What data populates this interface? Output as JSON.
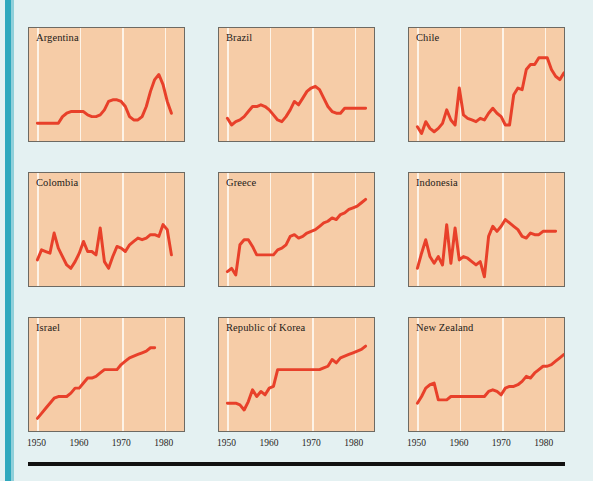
{
  "figure": {
    "background_color": "#e4f1f2",
    "panel_fill": "#f6cca7",
    "panel_border": "#6d6a63",
    "line_color": "#e8402a",
    "gridline_color": "#fdf4ea",
    "spine_color": "#2fa8bd",
    "rule_color": "#111111"
  },
  "chart_data": {
    "type": "line",
    "title": "",
    "xlabel": "",
    "ylabel": "",
    "xlim": [
      1948,
      1985
    ],
    "grid": true,
    "gridlines_at": [
      1950,
      1960,
      1970,
      1980
    ],
    "tick_labels": [
      "1950",
      "1960",
      "1970",
      "1980"
    ],
    "legend": "none",
    "layout": {
      "rows": 3,
      "cols": 3
    },
    "panels": [
      {
        "name": "Argentina",
        "row": 0,
        "col": 0,
        "x": [
          1950,
          1951,
          1952,
          1953,
          1954,
          1955,
          1956,
          1957,
          1958,
          1959,
          1960,
          1961,
          1962,
          1963,
          1964,
          1965,
          1966,
          1967,
          1968,
          1969,
          1970,
          1971,
          1972,
          1973,
          1974,
          1975,
          1976,
          1977,
          1978,
          1979,
          1980,
          1981,
          1982
        ],
        "y": [
          14,
          14,
          14,
          14,
          14,
          14,
          22,
          26,
          28,
          28,
          28,
          28,
          24,
          22,
          22,
          24,
          30,
          40,
          42,
          42,
          40,
          34,
          22,
          18,
          18,
          22,
          34,
          52,
          66,
          72,
          60,
          40,
          26
        ]
      },
      {
        "name": "Brazil",
        "row": 0,
        "col": 1,
        "x": [
          1950,
          1951,
          1952,
          1953,
          1954,
          1955,
          1956,
          1957,
          1958,
          1959,
          1960,
          1961,
          1962,
          1963,
          1964,
          1965,
          1966,
          1967,
          1968,
          1969,
          1970,
          1971,
          1972,
          1973,
          1974,
          1975,
          1976,
          1977,
          1978,
          1979,
          1980,
          1981,
          1982,
          1983
        ],
        "y": [
          20,
          12,
          16,
          18,
          22,
          28,
          34,
          34,
          36,
          34,
          30,
          24,
          18,
          16,
          22,
          30,
          40,
          36,
          44,
          52,
          56,
          58,
          54,
          44,
          34,
          28,
          26,
          26,
          32,
          32,
          32,
          32,
          32,
          32
        ]
      },
      {
        "name": "Chile",
        "row": 0,
        "col": 2,
        "x": [
          1950,
          1951,
          1952,
          1953,
          1954,
          1955,
          1956,
          1957,
          1958,
          1959,
          1960,
          1961,
          1962,
          1963,
          1964,
          1965,
          1966,
          1967,
          1968,
          1969,
          1970,
          1971,
          1972,
          1973,
          1974,
          1975,
          1976,
          1977,
          1978,
          1979,
          1980,
          1981,
          1982,
          1983,
          1984,
          1985
        ],
        "y": [
          10,
          2,
          16,
          8,
          4,
          8,
          14,
          30,
          18,
          12,
          56,
          24,
          20,
          18,
          16,
          20,
          18,
          26,
          32,
          26,
          22,
          12,
          12,
          48,
          56,
          54,
          78,
          84,
          84,
          92,
          92,
          92,
          78,
          70,
          66,
          74
        ]
      },
      {
        "name": "Colombia",
        "row": 1,
        "col": 0,
        "x": [
          1950,
          1951,
          1952,
          1953,
          1954,
          1955,
          1956,
          1957,
          1958,
          1959,
          1960,
          1961,
          1962,
          1963,
          1964,
          1965,
          1966,
          1967,
          1968,
          1969,
          1970,
          1971,
          1972,
          1973,
          1974,
          1975,
          1976,
          1977,
          1978,
          1979,
          1980,
          1981,
          1982
        ],
        "y": [
          24,
          36,
          34,
          32,
          56,
          38,
          28,
          18,
          14,
          22,
          32,
          46,
          34,
          34,
          30,
          62,
          22,
          14,
          28,
          40,
          38,
          34,
          42,
          46,
          50,
          48,
          50,
          54,
          54,
          52,
          66,
          60,
          30
        ]
      },
      {
        "name": "Greece",
        "row": 1,
        "col": 1,
        "x": [
          1950,
          1951,
          1952,
          1953,
          1954,
          1955,
          1956,
          1957,
          1958,
          1959,
          1960,
          1961,
          1962,
          1963,
          1964,
          1965,
          1966,
          1967,
          1968,
          1969,
          1970,
          1971,
          1972,
          1973,
          1974,
          1975,
          1976,
          1977,
          1978,
          1979,
          1980,
          1981,
          1982,
          1983
        ],
        "y": [
          10,
          14,
          6,
          42,
          48,
          48,
          40,
          30,
          30,
          30,
          30,
          30,
          36,
          38,
          42,
          52,
          54,
          50,
          52,
          56,
          58,
          60,
          64,
          68,
          70,
          74,
          72,
          78,
          80,
          84,
          86,
          88,
          92,
          96
        ]
      },
      {
        "name": "Indonesia",
        "row": 1,
        "col": 2,
        "x": [
          1950,
          1951,
          1952,
          1953,
          1954,
          1955,
          1956,
          1957,
          1958,
          1959,
          1960,
          1961,
          1962,
          1963,
          1964,
          1965,
          1966,
          1967,
          1968,
          1969,
          1970,
          1971,
          1972,
          1973,
          1974,
          1975,
          1976,
          1977,
          1978,
          1979,
          1980,
          1981,
          1982,
          1983
        ],
        "y": [
          14,
          32,
          48,
          28,
          20,
          28,
          18,
          66,
          20,
          62,
          24,
          28,
          26,
          22,
          18,
          22,
          4,
          52,
          64,
          58,
          64,
          72,
          68,
          64,
          60,
          52,
          50,
          56,
          54,
          54,
          58,
          58,
          58,
          58
        ]
      },
      {
        "name": "Israel",
        "row": 2,
        "col": 0,
        "x": [
          1950,
          1951,
          1952,
          1953,
          1954,
          1955,
          1956,
          1957,
          1958,
          1959,
          1960,
          1961,
          1962,
          1963,
          1964,
          1965,
          1966,
          1967,
          1968,
          1969,
          1970,
          1971,
          1972,
          1973,
          1974,
          1975,
          1976,
          1977,
          1978
        ],
        "y": [
          8,
          14,
          20,
          26,
          32,
          34,
          34,
          34,
          38,
          44,
          44,
          50,
          56,
          56,
          58,
          62,
          66,
          66,
          66,
          66,
          72,
          76,
          80,
          82,
          84,
          86,
          88,
          92,
          92
        ]
      },
      {
        "name": "Republic of Korea",
        "row": 2,
        "col": 1,
        "x": [
          1950,
          1951,
          1952,
          1953,
          1954,
          1955,
          1956,
          1957,
          1958,
          1959,
          1960,
          1961,
          1962,
          1963,
          1964,
          1965,
          1966,
          1967,
          1968,
          1969,
          1970,
          1971,
          1972,
          1973,
          1974,
          1975,
          1976,
          1977,
          1978,
          1979,
          1980,
          1981,
          1982,
          1983
        ],
        "y": [
          26,
          26,
          26,
          24,
          18,
          28,
          42,
          34,
          40,
          36,
          44,
          46,
          66,
          66,
          66,
          66,
          66,
          66,
          66,
          66,
          66,
          66,
          66,
          68,
          70,
          78,
          74,
          80,
          82,
          84,
          86,
          88,
          90,
          94
        ]
      },
      {
        "name": "New Zealand",
        "row": 2,
        "col": 2,
        "x": [
          1950,
          1951,
          1952,
          1953,
          1954,
          1955,
          1956,
          1957,
          1958,
          1959,
          1960,
          1961,
          1962,
          1963,
          1964,
          1965,
          1966,
          1967,
          1968,
          1969,
          1970,
          1971,
          1972,
          1973,
          1974,
          1975,
          1976,
          1977,
          1978,
          1979,
          1980,
          1981,
          1982,
          1983,
          1984,
          1985
        ],
        "y": [
          26,
          34,
          44,
          48,
          50,
          30,
          30,
          30,
          34,
          34,
          34,
          34,
          34,
          34,
          34,
          34,
          34,
          40,
          42,
          40,
          36,
          44,
          46,
          46,
          48,
          52,
          58,
          56,
          62,
          66,
          70,
          70,
          72,
          76,
          80,
          84
        ]
      }
    ]
  }
}
